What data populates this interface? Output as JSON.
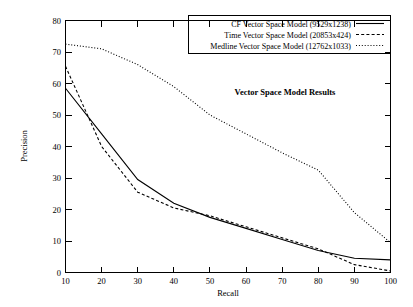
{
  "chart_data": {
    "type": "line",
    "title": "",
    "annotation": "Vector Space Model Results",
    "xlabel": "Recall",
    "ylabel": "Precision",
    "xlim": [
      10,
      100
    ],
    "ylim": [
      0,
      80
    ],
    "xticks": [
      10,
      20,
      30,
      40,
      50,
      60,
      70,
      80,
      90,
      100
    ],
    "yticks": [
      0,
      10,
      20,
      30,
      40,
      50,
      60,
      70,
      80
    ],
    "grid": false,
    "legend_position": "top-right",
    "x": [
      10,
      20,
      30,
      40,
      50,
      60,
      70,
      80,
      90,
      100
    ],
    "series": [
      {
        "name": "CF Vector Space Model (9529x1238)",
        "style": "solid",
        "color": "#000000",
        "values": [
          58.5,
          44.0,
          29.5,
          22.0,
          17.5,
          14.0,
          10.5,
          7.0,
          4.5,
          4.0
        ]
      },
      {
        "name": "Time Vector Space Model (20853x424)",
        "style": "dashed",
        "color": "#000000",
        "values": [
          65.5,
          40.0,
          25.5,
          20.5,
          18.0,
          14.5,
          11.0,
          7.5,
          2.5,
          0.5
        ]
      },
      {
        "name": "Medline Vector Space Model (12762x1033)",
        "style": "dotted",
        "color": "#000000",
        "values": [
          72.5,
          71.0,
          66.0,
          59.0,
          50.0,
          44.0,
          38.0,
          32.5,
          19.0,
          9.5
        ]
      }
    ]
  },
  "axes": {
    "x_title": "Recall",
    "y_title": "Precision",
    "x_tick_labels": [
      "10",
      "20",
      "30",
      "40",
      "50",
      "60",
      "70",
      "80",
      "90",
      "100"
    ],
    "y_tick_labels": [
      "0",
      "10",
      "20",
      "30",
      "40",
      "50",
      "60",
      "70",
      "80"
    ]
  },
  "legend": {
    "entries": [
      {
        "label": "CF Vector Space Model (9529x1238)",
        "style": "solid"
      },
      {
        "label": "Time Vector Space Model (20853x424)",
        "style": "dashed"
      },
      {
        "label": "Medline Vector Space Model (12762x1033)",
        "style": "dotted"
      }
    ]
  },
  "annotation": {
    "text": "Vector Space Model Results"
  }
}
